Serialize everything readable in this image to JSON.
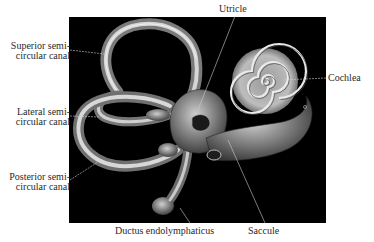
{
  "figure": {
    "background_color": "#000000",
    "labels": {
      "superior": [
        "Superior semi-",
        "circular canal"
      ],
      "lateral": [
        "Lateral semi-",
        "circular canal"
      ],
      "posterior": [
        "Posterior semi-",
        "circular canal"
      ],
      "utricle": "Utricle",
      "cochlea": "Cochlea",
      "ductus": "Ductus endolymphaticus",
      "saccule": "Saccule"
    }
  }
}
